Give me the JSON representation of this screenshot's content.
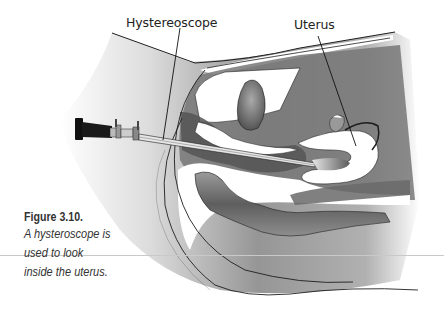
{
  "figure": {
    "labels": {
      "hysteroscope": "Hystereoscope",
      "uterus": "Uterus"
    },
    "caption": {
      "title": "Figure 3.10.",
      "text": "A hysteroscope is\nused to look\ninside the uterus."
    },
    "colors": {
      "tissue_dark": "#6e6e6e",
      "tissue_mid": "#9a9a9a",
      "tissue_light": "#d6d6d6",
      "cavity": "#ffffff",
      "outline": "#1e1e1e",
      "scope_body": "#111111",
      "scope_metal": "#bdbdbd"
    }
  }
}
